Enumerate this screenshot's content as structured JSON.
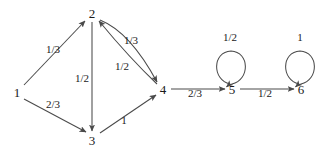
{
  "diagram": {
    "type": "directed-graph",
    "width": 332,
    "height": 161,
    "colors": {
      "background": "#ffffff",
      "stroke": "#4a4a4a",
      "text": "#1a1a1a"
    },
    "nodes": [
      {
        "id": "1",
        "label": "1",
        "x": 17,
        "y": 92
      },
      {
        "id": "2",
        "label": "2",
        "x": 92,
        "y": 13
      },
      {
        "id": "3",
        "label": "3",
        "x": 92,
        "y": 140
      },
      {
        "id": "4",
        "label": "4",
        "x": 163,
        "y": 89
      },
      {
        "id": "5",
        "label": "5",
        "x": 232,
        "y": 89
      },
      {
        "id": "6",
        "label": "6",
        "x": 301,
        "y": 89
      }
    ],
    "edges": [
      {
        "from": "1",
        "to": "2",
        "label": "1/3",
        "lx": 53,
        "ly": 49,
        "shape": "straight"
      },
      {
        "from": "1",
        "to": "3",
        "label": "2/3",
        "lx": 53,
        "ly": 104,
        "shape": "straight"
      },
      {
        "from": "2",
        "to": "3",
        "label": "1/2",
        "lx": 82,
        "ly": 78,
        "shape": "straight"
      },
      {
        "from": "2",
        "to": "4",
        "label": "1/3",
        "lx": 131,
        "ly": 40,
        "shape": "curve-outer"
      },
      {
        "from": "4",
        "to": "2",
        "label": "1/2",
        "lx": 122,
        "ly": 66,
        "shape": "curve-inner"
      },
      {
        "from": "3",
        "to": "4",
        "label": "1",
        "lx": 124,
        "ly": 120,
        "shape": "straight"
      },
      {
        "from": "4",
        "to": "5",
        "label": "2/3",
        "lx": 195,
        "ly": 93,
        "shape": "straight"
      },
      {
        "from": "5",
        "to": "6",
        "label": "1/2",
        "lx": 265,
        "ly": 93,
        "shape": "straight"
      },
      {
        "from": "5",
        "to": "5",
        "label": "1/2",
        "lx": 230,
        "ly": 37,
        "shape": "self-loop"
      },
      {
        "from": "6",
        "to": "6",
        "label": "1",
        "lx": 300,
        "ly": 37,
        "shape": "self-loop"
      }
    ]
  }
}
